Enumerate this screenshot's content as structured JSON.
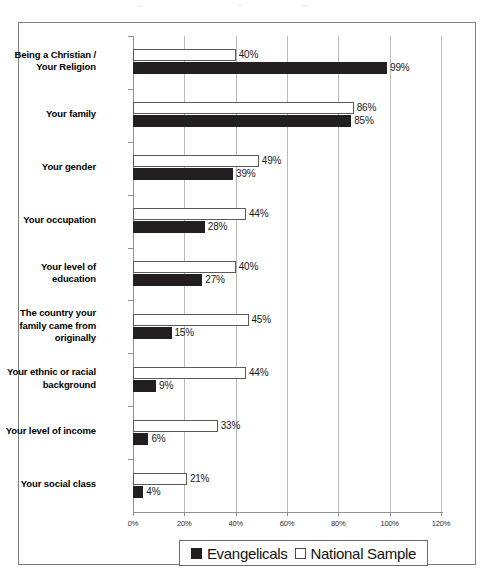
{
  "chart_data": {
    "type": "bar",
    "orientation": "horizontal",
    "title": "",
    "subtitle": "",
    "xlabel": "",
    "ylabel": "",
    "xlim": [
      0,
      120
    ],
    "xtick_labels": [
      "0%",
      "20%",
      "40%",
      "60%",
      "80%",
      "100%",
      "120%"
    ],
    "xticks": [
      0,
      20,
      40,
      60,
      80,
      100,
      120
    ],
    "grid": true,
    "grid_axis": "x",
    "legend_position": "bottom",
    "value_suffix": "%",
    "categories": [
      "Being a Christian /\nYour Religion",
      "Your family",
      "Your gender",
      "Your occupation",
      "Your level of\neducation",
      "The country your\nfamily came from\noriginally",
      "Your ethnic or racial\nbackground",
      "Your level of income",
      "Your social class"
    ],
    "series": [
      {
        "name": "National Sample",
        "color": "#ffffff",
        "edge_color": "#5a5a5a",
        "values": [
          40,
          86,
          49,
          44,
          40,
          45,
          44,
          33,
          21
        ],
        "labels": [
          "40%",
          "86%",
          "49%",
          "44%",
          "40%",
          "45%",
          "44%",
          "33%",
          "21%"
        ]
      },
      {
        "name": "Evangelicals",
        "color": "#231f20",
        "edge_color": "#231f20",
        "values": [
          99,
          85,
          39,
          28,
          27,
          15,
          9,
          6,
          4
        ],
        "labels": [
          "99%",
          "85%",
          "39%",
          "28%",
          "27%",
          "15%",
          "9%",
          "6%",
          "4%"
        ]
      }
    ]
  },
  "categories_display": [
    {
      "lines": [
        "Being a Christian /",
        "Your Religion"
      ]
    },
    {
      "lines": [
        "Your family"
      ]
    },
    {
      "lines": [
        "Your gender"
      ]
    },
    {
      "lines": [
        "Your occupation"
      ]
    },
    {
      "lines": [
        "Your level of",
        "education"
      ]
    },
    {
      "lines": [
        "The country your",
        "family came from",
        "originally"
      ]
    },
    {
      "lines": [
        "Your ethnic or racial",
        "background"
      ]
    },
    {
      "lines": [
        "Your level of income"
      ]
    },
    {
      "lines": [
        "Your social class"
      ]
    }
  ],
  "legend": {
    "items": [
      {
        "label": "Evangelicals",
        "swatch": "filled-black-square"
      },
      {
        "label": "National Sample",
        "swatch": "open-white-square"
      }
    ]
  }
}
